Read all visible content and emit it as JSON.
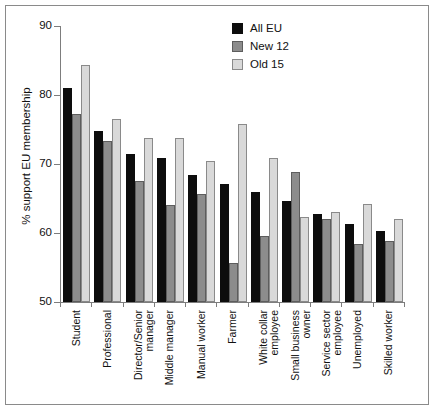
{
  "chart_data": {
    "type": "bar",
    "title": "",
    "xlabel": "",
    "ylabel": "% support EU membership",
    "ylim": [
      50,
      90
    ],
    "yticks": [
      50,
      60,
      70,
      80,
      90
    ],
    "grid": false,
    "legend_position": "top-right",
    "categories": [
      "Student",
      "Professional",
      "Director/Senior manager",
      "Middle manager",
      "Manual worker",
      "Farmer",
      "White collar employee",
      "Small business owner",
      "Service sector employee",
      "Unemployed",
      "Skilled worker"
    ],
    "category_lines": [
      [
        "Student",
        ""
      ],
      [
        "Professional",
        ""
      ],
      [
        "Director/Senior",
        "manager"
      ],
      [
        "Middle manager",
        ""
      ],
      [
        "Manual worker",
        ""
      ],
      [
        "Farmer",
        ""
      ],
      [
        "White collar",
        "employee"
      ],
      [
        "Small business",
        "owner"
      ],
      [
        "Service sector",
        "employee"
      ],
      [
        "Unemployed",
        ""
      ],
      [
        "Skilled worker",
        ""
      ]
    ],
    "series": [
      {
        "name": "All EU",
        "color": "#0d0d0d",
        "values": [
          81.0,
          74.8,
          71.4,
          70.8,
          68.4,
          67.1,
          66.0,
          64.6,
          62.7,
          61.3,
          60.3
        ]
      },
      {
        "name": "New 12",
        "color": "#8c8c8c",
        "values": [
          77.2,
          73.3,
          67.5,
          64.1,
          65.6,
          55.6,
          59.6,
          68.9,
          62.0,
          58.4,
          58.8
        ]
      },
      {
        "name": "Old 15",
        "color": "#d9d9d9",
        "values": [
          84.3,
          76.5,
          73.7,
          73.7,
          70.4,
          75.8,
          70.9,
          62.3,
          63.0,
          64.2,
          62.0
        ]
      }
    ]
  }
}
